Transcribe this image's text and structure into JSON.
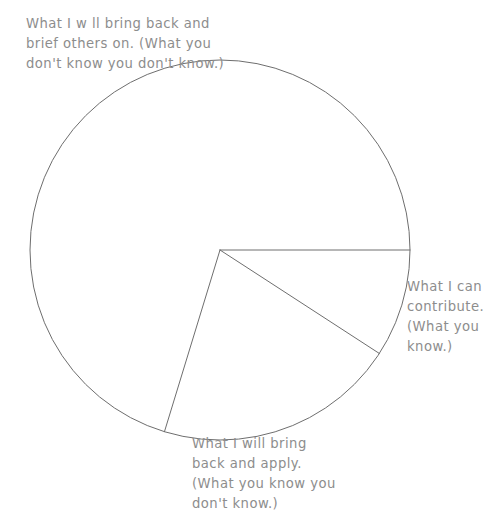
{
  "page": {
    "background_color": "#ffffff",
    "stroke_color": "#6e6e6e",
    "text_color": "#8d8d8d"
  },
  "chart_data": {
    "type": "pie",
    "title": "",
    "subtitle": "",
    "xlabel": "",
    "ylabel": "",
    "grid": false,
    "legend_position": "none",
    "center": {
      "x": 220,
      "y": 250
    },
    "radius": 190,
    "filled": false,
    "labels": [
      "What I w ll bring back and brief others on. (What you don't know you don't know.)",
      "What I can contribute. (What you know.)",
      "What I will bring back and apply. (What you know you don't know.)"
    ],
    "values": [
      70.3,
      9.2,
      20.5
    ],
    "units": "percent",
    "start_angle_deg": 0,
    "slices": [
      {
        "name": "unknown-unknowns",
        "label": "What I w ll bring back and brief others on. (What you don't know you don't know.)",
        "value": 70.3,
        "start_angle_deg": 107,
        "end_angle_deg": 360
      },
      {
        "name": "knowns",
        "label": "What I can contribute. (What you know.)",
        "value": 9.2,
        "start_angle_deg": 0,
        "end_angle_deg": 33
      },
      {
        "name": "known-unknowns",
        "label": "What I will bring back and apply. (What you know you don't know.)",
        "value": 20.5,
        "start_angle_deg": 33,
        "end_angle_deg": 107
      }
    ]
  },
  "captions": {
    "unknown_unknown": "What I w ll bring back and\nbrief others on. (What you\ndon't know you don't know.)",
    "known": "What I can\ncontribute.\n(What you\nknow.)",
    "known_unknown": "What I will bring\nback and apply.\n(What you know you\ndon't know.)"
  }
}
